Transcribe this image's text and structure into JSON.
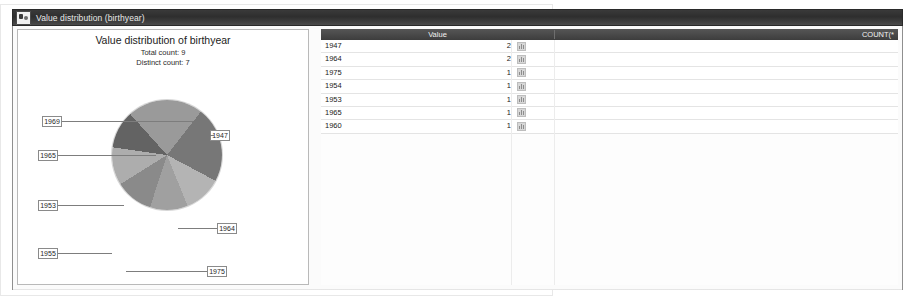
{
  "window": {
    "title": "Value distribution (birthyear)",
    "icon": "cards-icon"
  },
  "chart_panel": {
    "title": "Value distribution of birthyear",
    "total_count_label": "Total count: 9",
    "distinct_count_label": "Distinct count: 7"
  },
  "table": {
    "columns": [
      "Value",
      "COUNT(*"
    ],
    "rows": [
      {
        "value": "1947",
        "count": "2"
      },
      {
        "value": "1964",
        "count": "2"
      },
      {
        "value": "1975",
        "count": "1"
      },
      {
        "value": "1954",
        "count": "1"
      },
      {
        "value": "1953",
        "count": "1"
      },
      {
        "value": "1965",
        "count": "1"
      },
      {
        "value": "1960",
        "count": "1"
      }
    ]
  },
  "chart_data": {
    "type": "pie",
    "title": "Value distribution of birthyear",
    "labels": [
      "1947",
      "1964",
      "1975",
      "1954",
      "1953",
      "1955",
      "1960"
    ],
    "values": [
      2,
      2,
      1,
      1,
      1,
      1,
      1
    ],
    "total": 9,
    "distinct": 7,
    "legend": "none",
    "callout_labels": [
      "1947",
      "1964",
      "1975",
      "1955",
      "1953",
      "1965",
      "1969"
    ],
    "colors": [
      "#9a9a9a",
      "#777777",
      "#b4b4b4",
      "#a0a0a0",
      "#8a8a8a",
      "#adadad",
      "#636363"
    ]
  }
}
